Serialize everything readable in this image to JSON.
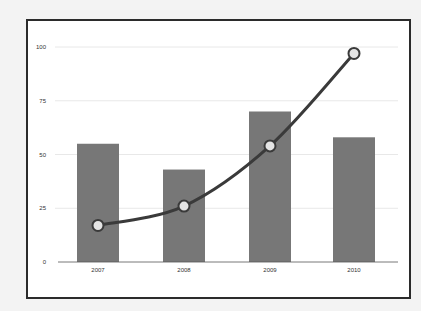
{
  "chart_data": {
    "type": "bar+line",
    "title": "",
    "xlabel": "",
    "ylabel": "",
    "categories": [
      "2007",
      "2008",
      "2009",
      "2010"
    ],
    "series": [
      {
        "name": "bars",
        "type": "bar",
        "values": [
          55,
          43,
          70,
          58
        ],
        "color": "#777777"
      },
      {
        "name": "line",
        "type": "line",
        "values": [
          17,
          26,
          54,
          97
        ],
        "color": "#3a3a3a",
        "marker_fill": "#e4e4e4"
      }
    ],
    "yticks": [
      "0",
      "25",
      "50",
      "75",
      "100"
    ],
    "ylim": [
      0,
      100
    ],
    "grid": true,
    "legend": null
  }
}
